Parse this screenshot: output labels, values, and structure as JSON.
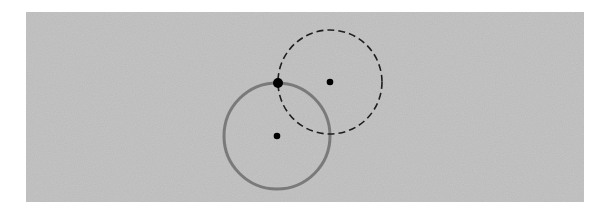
{
  "diagram": {
    "background_color": "#b9b9b9",
    "panel": {
      "x": 26,
      "y": 12,
      "width": 558,
      "height": 190
    },
    "circles": [
      {
        "id": "solid-circle",
        "cx": 277,
        "cy": 136,
        "r": 53,
        "stroke": "#7a7a7a",
        "stroke_width": 3,
        "dashed": false
      },
      {
        "id": "dashed-circle",
        "cx": 330,
        "cy": 82,
        "r": 52,
        "stroke": "#1e1e1e",
        "stroke_width": 1.6,
        "dashed": true
      }
    ],
    "points": [
      {
        "id": "intersection-point",
        "cx": 278,
        "cy": 83,
        "r": 5,
        "fill": "#000000"
      },
      {
        "id": "dashed-circle-center",
        "cx": 330,
        "cy": 82,
        "r": 3.3,
        "fill": "#000000"
      },
      {
        "id": "solid-circle-center",
        "cx": 277,
        "cy": 136,
        "r": 3.3,
        "fill": "#000000"
      }
    ]
  }
}
